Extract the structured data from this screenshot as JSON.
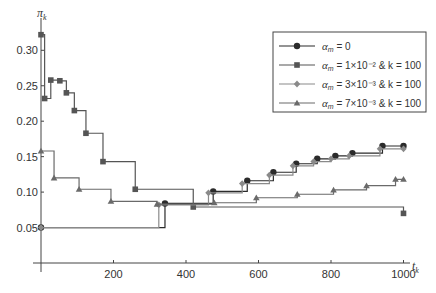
{
  "chart_data": {
    "type": "line",
    "step": true,
    "title": "",
    "xlabel": "t_k",
    "ylabel": "π_k",
    "xlim": [
      0,
      1000
    ],
    "ylim": [
      0,
      0.33
    ],
    "x_ticks": [
      200,
      400,
      600,
      800,
      1000
    ],
    "x_tick_labels": [
      "200",
      "400",
      "600",
      "800",
      "1000"
    ],
    "y_ticks": [
      0.05,
      0.1,
      0.15,
      0.2,
      0.25,
      0.3
    ],
    "y_tick_labels": [
      "0.05",
      "0.10",
      "0.15",
      "0.20",
      "0.25",
      "0.30"
    ],
    "grid": false,
    "legend_position": "upper right",
    "series": [
      {
        "name": "α_m = 0",
        "legend_main": "α",
        "legend_sub": "m",
        "legend_rest": " = 0",
        "marker": "circle",
        "color": "#2b2b2b",
        "x": [
          0,
          342,
          475,
          569,
          641,
          704,
          762,
          812,
          859,
          942,
          1000
        ],
        "y": [
          0.05,
          0.084,
          0.101,
          0.116,
          0.128,
          0.14,
          0.147,
          0.151,
          0.155,
          0.165,
          0.165
        ]
      },
      {
        "name": "α_m = 1×10^-2 & k = 100",
        "legend_main": "α",
        "legend_sub": "m",
        "legend_rest": " = 1×10⁻² & k = 100",
        "marker": "square",
        "color": "#555555",
        "x": [
          0,
          10,
          27,
          52,
          70,
          92,
          124,
          171,
          260,
          420,
          1000
        ],
        "y": [
          0.322,
          0.232,
          0.258,
          0.257,
          0.24,
          0.215,
          0.183,
          0.143,
          0.104,
          0.079,
          0.07
        ]
      },
      {
        "name": "α_m = 3×10^-3 & k = 100",
        "legend_main": "α",
        "legend_sub": "m",
        "legend_rest": " = 3×10⁻³ & k = 100",
        "marker": "diamond",
        "color": "#8a8a8a",
        "x": [
          0,
          325,
          462,
          555,
          630,
          695,
          752,
          800,
          850,
          935,
          1000
        ],
        "y": [
          0.05,
          0.082,
          0.099,
          0.112,
          0.124,
          0.137,
          0.143,
          0.147,
          0.151,
          0.161,
          0.161
        ]
      },
      {
        "name": "α_m = 7×10^-3 & k = 100",
        "legend_main": "α",
        "legend_sub": "m",
        "legend_rest": " = 7×10⁻³ & k = 100",
        "marker": "triangle",
        "color": "#6a6a6a",
        "x": [
          0,
          36,
          105,
          193,
          320,
          478,
          594,
          707,
          807,
          898,
          978,
          1000
        ],
        "y": [
          0.158,
          0.12,
          0.104,
          0.087,
          0.083,
          0.085,
          0.092,
          0.097,
          0.103,
          0.109,
          0.118,
          0.118
        ]
      }
    ]
  }
}
